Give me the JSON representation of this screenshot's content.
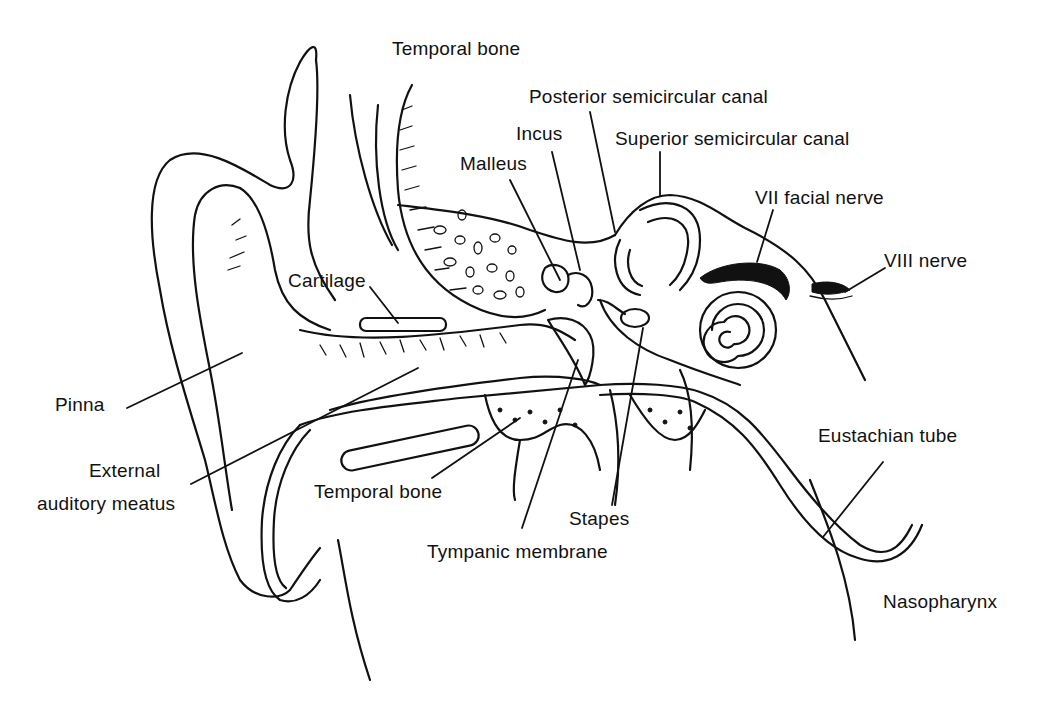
{
  "figure": {
    "labels": {
      "temporal_bone_top": "Temporal bone",
      "posterior_semicircular_canal": "Posterior semicircular canal",
      "incus": "Incus",
      "superior_semicircular_canal": "Superior semicircular canal",
      "malleus": "Malleus",
      "vii_facial_nerve": "VII facial nerve",
      "viii_nerve": "VIII nerve",
      "cartilage": "Cartilage",
      "pinna": "Pinna",
      "external_auditory_meatus_line1": "External",
      "external_auditory_meatus_line2": "auditory meatus",
      "temporal_bone_bottom": "Temporal bone",
      "stapes": "Stapes",
      "tympanic_membrane": "Tympanic membrane",
      "eustachian_tube": "Eustachian tube",
      "nasopharynx": "Nasopharynx"
    },
    "colors": {
      "ink": "#111111",
      "background": "#ffffff"
    }
  }
}
